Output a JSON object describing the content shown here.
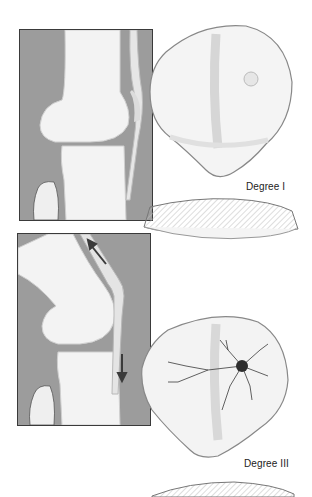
{
  "figure": {
    "colors": {
      "background": "#ffffff",
      "panel_gray": "#9c9c9c",
      "bone": "#f2f2f2",
      "outline": "#3a3a3a",
      "lesion": "#2a2a2a"
    },
    "panels": [
      {
        "id": "knee-extended",
        "arrows": 0
      },
      {
        "id": "knee-flexed",
        "arrows": 2,
        "arrow_directions": [
          "up-left",
          "down"
        ]
      }
    ],
    "patellae": [
      {
        "label": "Degree I",
        "feature": "small blister / softening"
      },
      {
        "label": "Degree III",
        "feature": "fissured lesion with radiating cracks"
      }
    ]
  }
}
